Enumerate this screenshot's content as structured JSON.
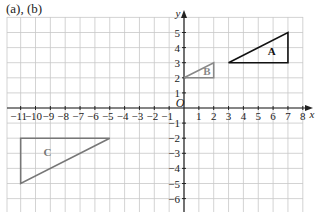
{
  "caption": "(a), (b)",
  "axes": {
    "x_label": "x",
    "y_label": "y",
    "origin_label": "O",
    "x_ticks": [
      -11,
      -10,
      -9,
      -8,
      -7,
      -6,
      -5,
      -4,
      -3,
      -2,
      -1,
      1,
      2,
      3,
      4,
      5,
      6,
      7,
      8
    ],
    "y_ticks": [
      -6,
      -5,
      -4,
      -3,
      -2,
      -1,
      1,
      2,
      3,
      4,
      5
    ]
  },
  "grid": {
    "x_min": -12,
    "x_max": 8,
    "y_min": -7,
    "y_max": 6
  },
  "shapes": [
    {
      "label": "A",
      "points": [
        [
          3,
          3
        ],
        [
          7,
          3
        ],
        [
          7,
          5
        ]
      ],
      "color": "#111111",
      "label_pos": [
        5.9,
        3.5
      ]
    },
    {
      "label": "B",
      "points": [
        [
          0,
          2
        ],
        [
          2,
          2
        ],
        [
          2,
          3
        ]
      ],
      "color": "#888888",
      "label_pos": [
        1.55,
        2.2
      ]
    },
    {
      "label": "C",
      "points": [
        [
          -11,
          -2
        ],
        [
          -5,
          -2
        ],
        [
          -11,
          -5
        ]
      ],
      "color": "#777777",
      "label_pos": [
        -9.2,
        -3.2
      ]
    }
  ],
  "colors": {
    "grid": "#c8c8c8",
    "axis": "#222222",
    "text": "#222222"
  }
}
